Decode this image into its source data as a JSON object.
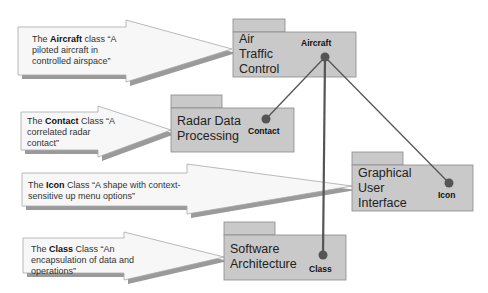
{
  "colors": {
    "background": "#ffffff",
    "package_fill": "#c9c9c9",
    "package_border": "#8a8a8a",
    "connector": "#555555",
    "dot": "#555555",
    "callout_fill": "#f7f7f7",
    "callout_shadow": "#9a9a9a"
  },
  "callouts": [
    {
      "prefix": "The ",
      "bold": "Aircraft",
      "suffix": " class “A piloted aircraft in controlled airspace”"
    },
    {
      "prefix": "The ",
      "bold": "Contact",
      "suffix": " Class “A correlated radar contact”"
    },
    {
      "prefix": "The ",
      "bold": "Icon",
      "suffix": " Class “A shape with context-sensitive up menu options”"
    },
    {
      "prefix": "The ",
      "bold": "Class",
      "suffix": " Class “An encapsulation of data and operations”"
    }
  ],
  "packages": [
    {
      "name_lines": [
        "Air",
        "Traffic",
        "Control"
      ],
      "class_label": "Aircraft"
    },
    {
      "name_lines": [
        "Radar Data",
        "Processing"
      ],
      "class_label": "Contact"
    },
    {
      "name_lines": [
        "Graphical",
        "User",
        "Interface"
      ],
      "class_label": "Icon"
    },
    {
      "name_lines": [
        "Software",
        "Architecture"
      ],
      "class_label": "Class"
    }
  ]
}
